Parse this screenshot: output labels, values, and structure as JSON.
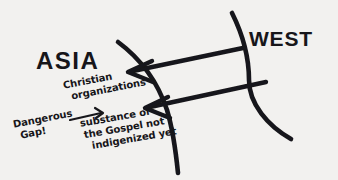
{
  "figure": {
    "kind": "hand-drawn-diagram",
    "background_color": "#f2f1ef",
    "ink_color": "#17161a",
    "width": 338,
    "height": 180
  },
  "labels": {
    "asia": "ASIA",
    "west": "WEST"
  },
  "annotations": {
    "christian_organizations": {
      "line1": "Christian",
      "line2": "organizations"
    },
    "dangerous_gap": {
      "line1": "Dangerous",
      "line2": "Gap!"
    },
    "gospel_substance": {
      "line1": "substance of",
      "line2": "the Gospel not",
      "line3": "indigenized yet"
    }
  },
  "shapes": {
    "boundary_curve_left": "inner boundary arc",
    "boundary_curve_right": "outer boundary arc",
    "arrow_upper": "arrow from WEST to ASIA (upper)",
    "arrow_lower": "arrow from WEST to ASIA (lower)",
    "arrow_gap": "short arrow from Dangerous Gap to substance note"
  }
}
